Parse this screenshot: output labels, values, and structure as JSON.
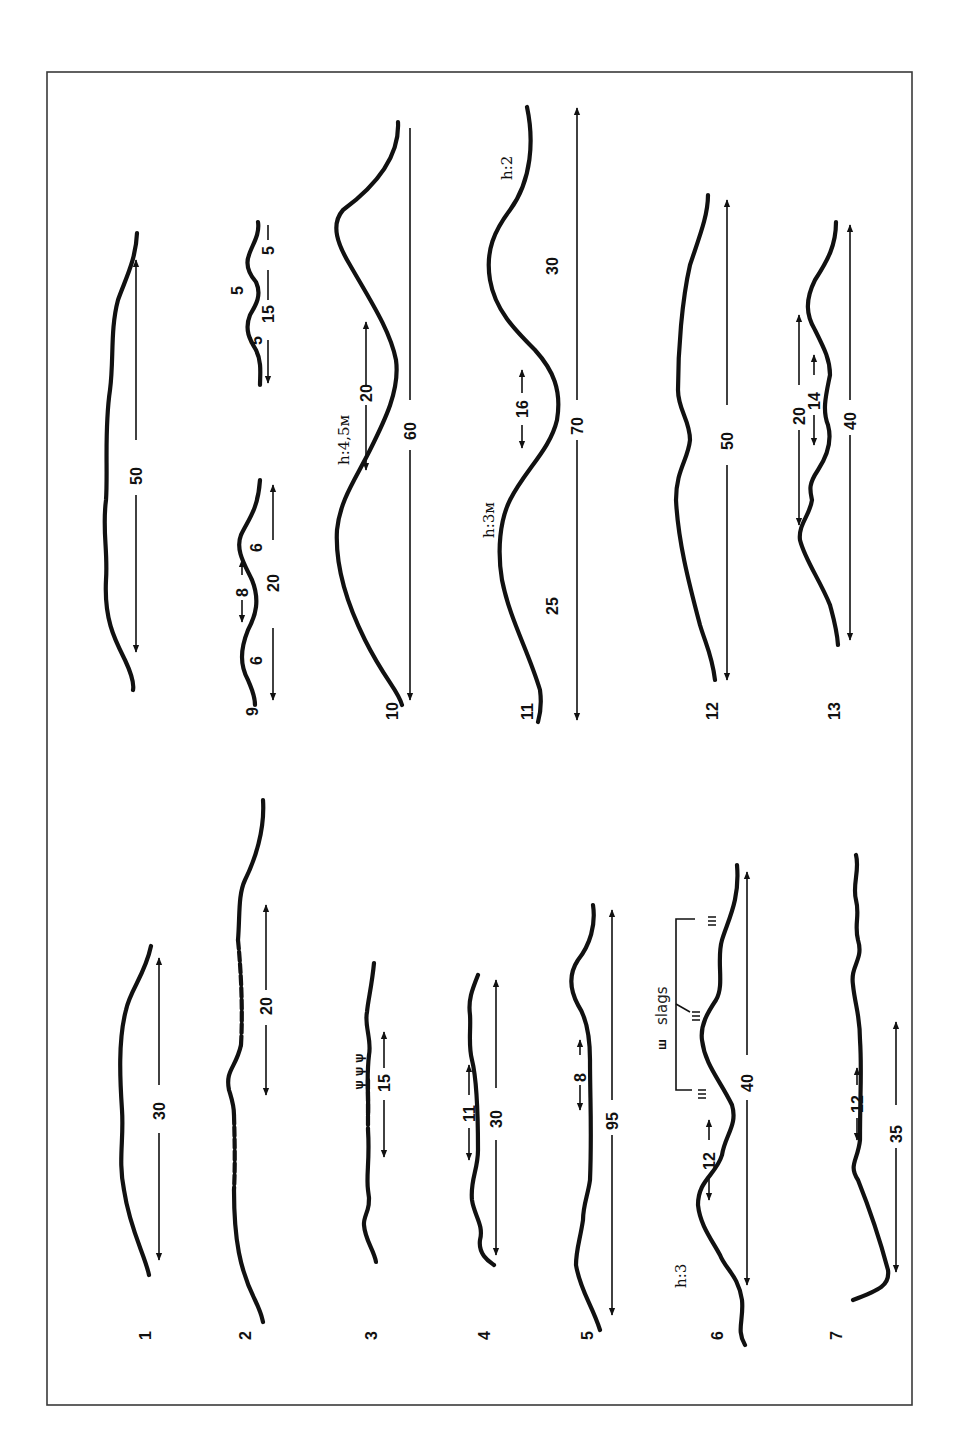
{
  "figure": {
    "orientation": "rotated 90 degrees counter-clockwise",
    "border_color": "#3a3a3a",
    "stroke_color": "#111111",
    "annotation": {
      "slags_label": "slags"
    }
  },
  "profiles": [
    {
      "id": "1",
      "label": "1",
      "dimensions": [
        "30"
      ]
    },
    {
      "id": "2",
      "label": "2",
      "dimensions": [
        "20"
      ],
      "note": "dashed segments"
    },
    {
      "id": "3",
      "label": "3",
      "dimensions": [
        "15"
      ],
      "note": "vegetation marks"
    },
    {
      "id": "4",
      "label": "4",
      "dimensions": [
        "11",
        "30"
      ]
    },
    {
      "id": "5",
      "label": "5",
      "dimensions": [
        "8",
        "95"
      ]
    },
    {
      "id": "6",
      "label": "6",
      "dimensions": [
        "12",
        "40"
      ],
      "height_label": "h:3",
      "note": "slags"
    },
    {
      "id": "7",
      "label": "7",
      "dimensions": [
        "12",
        "35"
      ]
    },
    {
      "id": "8",
      "label": "",
      "dimensions": [
        "50"
      ]
    },
    {
      "id": "9",
      "label": "9",
      "dimensions": [
        "6",
        "8",
        "6",
        "20",
        "5",
        "5",
        "5",
        "15"
      ]
    },
    {
      "id": "10",
      "label": "10",
      "dimensions": [
        "20",
        "60"
      ],
      "height_label": "h:4,5м"
    },
    {
      "id": "11",
      "label": "11",
      "dimensions": [
        "25",
        "16",
        "70",
        "30"
      ],
      "height_labels": [
        "h:3м",
        "h:2"
      ]
    },
    {
      "id": "12",
      "label": "12",
      "dimensions": [
        "50"
      ]
    },
    {
      "id": "13",
      "label": "13",
      "dimensions": [
        "20",
        "14",
        "40"
      ]
    }
  ],
  "labels": {
    "p1": "1",
    "p2": "2",
    "p3": "3",
    "p4": "4",
    "p5": "5",
    "p6": "6",
    "p7": "7",
    "p9": "9",
    "p10": "10",
    "p11": "11",
    "p12": "12",
    "p13": "13",
    "d1_30": "30",
    "d2_20": "20",
    "d3_15": "15",
    "d4_11": "11",
    "d4_30": "30",
    "d5_8": "8",
    "d5_95": "95",
    "d6_12": "12",
    "d6_40": "40",
    "h6": "h:3",
    "d7_12": "12",
    "d7_35": "35",
    "d8_50": "50",
    "d9_6a": "6",
    "d9_8": "8",
    "d9_6b": "6",
    "d9_20": "20",
    "d9_5a": "5",
    "d9_5b": "5",
    "d9_5c": "5",
    "d9_15": "15",
    "d10_20": "20",
    "d10_60": "60",
    "h10": "h:4,5м",
    "d11_25": "25",
    "d11_16": "16",
    "d11_70": "70",
    "d11_30": "30",
    "h11a": "h:3м",
    "h11b": "h:2",
    "d12_50": "50",
    "d13_20": "20",
    "d13_14": "14",
    "d13_40": "40",
    "slags": "slags"
  }
}
